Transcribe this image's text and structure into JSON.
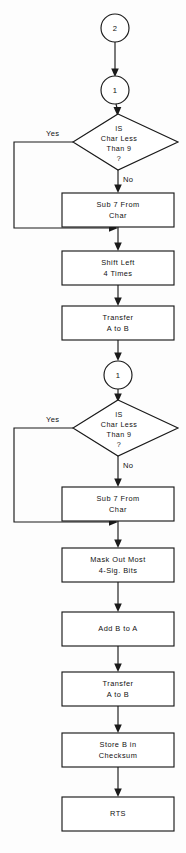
{
  "diagram": {
    "type": "flowchart",
    "colors": {
      "stroke": "#1a1a1a",
      "fill": "#ffffff",
      "background": "#fdfdfd",
      "text": "#111111"
    },
    "connectors": [
      {
        "id": "conn-top-2",
        "label": "2",
        "cx": 115,
        "cy": 28,
        "r": 14
      },
      {
        "id": "conn-top-1",
        "label": "1",
        "cx": 115,
        "cy": 90,
        "r": 14
      },
      {
        "id": "conn-mid-1",
        "label": "1",
        "cx": 118,
        "cy": 375,
        "r": 14
      }
    ],
    "decisions": [
      {
        "id": "decision-1",
        "line1": "IS",
        "line2": "Char Less",
        "line3": "Than 9",
        "line4": "?",
        "yes_label": "Yes",
        "no_label": "No",
        "cx": 118,
        "cy": 142
      },
      {
        "id": "decision-2",
        "line1": "IS",
        "line2": "Char Less",
        "line3": "Than 9",
        "line4": "?",
        "yes_label": "Yes",
        "no_label": "No",
        "cx": 118,
        "cy": 428
      }
    ],
    "processes": [
      {
        "id": "proc-sub7-a",
        "line1": "Sub 7 From",
        "line2": "Char",
        "x": 62,
        "y": 193,
        "w": 112,
        "h": 34
      },
      {
        "id": "proc-shift-left",
        "line1": "Shift Left",
        "line2": "4 Times",
        "x": 62,
        "y": 251,
        "w": 112,
        "h": 34
      },
      {
        "id": "proc-transfer-ab-1",
        "line1": "Transfer",
        "line2": "A to B",
        "x": 62,
        "y": 306,
        "w": 112,
        "h": 34
      },
      {
        "id": "proc-sub7-b",
        "line1": "Sub 7 From",
        "line2": "Char",
        "x": 62,
        "y": 487,
        "w": 112,
        "h": 34
      },
      {
        "id": "proc-mask-out",
        "line1": "Mask Out Most",
        "line2": "4-Sig. Bits",
        "x": 62,
        "y": 548,
        "w": 112,
        "h": 34
      },
      {
        "id": "proc-add-b-a",
        "line1": "Add B to A",
        "line2": "",
        "x": 62,
        "y": 612,
        "w": 112,
        "h": 34
      },
      {
        "id": "proc-transfer-ab-2",
        "line1": "Transfer",
        "line2": "A to B",
        "x": 62,
        "y": 672,
        "w": 112,
        "h": 34
      },
      {
        "id": "proc-store-b",
        "line1": "Store B in",
        "line2": "Checksum",
        "x": 62,
        "y": 733,
        "w": 112,
        "h": 34
      },
      {
        "id": "proc-rts",
        "line1": "RTS",
        "line2": "",
        "x": 62,
        "y": 797,
        "w": 112,
        "h": 34
      }
    ],
    "edges": [
      {
        "id": "edge-2-to-1",
        "from": "conn-top-2",
        "to": "conn-top-1"
      },
      {
        "id": "edge-1-to-decision1",
        "from": "conn-top-1",
        "to": "decision-1"
      },
      {
        "id": "edge-decision1-no",
        "from": "decision-1",
        "to": "proc-sub7-a",
        "label": "No"
      },
      {
        "id": "edge-decision1-yes",
        "from": "decision-1",
        "to": "merge-1",
        "label": "Yes"
      },
      {
        "id": "edge-sub7a-to-shift",
        "from": "proc-sub7-a",
        "to": "proc-shift-left"
      },
      {
        "id": "edge-shift-to-transfer",
        "from": "proc-shift-left",
        "to": "proc-transfer-ab-1"
      },
      {
        "id": "edge-transfer-to-conn1",
        "from": "proc-transfer-ab-1",
        "to": "conn-mid-1"
      },
      {
        "id": "edge-conn1-to-decision2",
        "from": "conn-mid-1",
        "to": "decision-2"
      },
      {
        "id": "edge-decision2-no",
        "from": "decision-2",
        "to": "proc-sub7-b",
        "label": "No"
      },
      {
        "id": "edge-decision2-yes",
        "from": "decision-2",
        "to": "merge-2",
        "label": "Yes"
      },
      {
        "id": "edge-sub7b-to-mask",
        "from": "proc-sub7-b",
        "to": "proc-mask-out"
      },
      {
        "id": "edge-mask-to-add",
        "from": "proc-mask-out",
        "to": "proc-add-b-a"
      },
      {
        "id": "edge-add-to-transfer2",
        "from": "proc-add-b-a",
        "to": "proc-transfer-ab-2"
      },
      {
        "id": "edge-transfer2-to-store",
        "from": "proc-transfer-ab-2",
        "to": "proc-store-b"
      },
      {
        "id": "edge-store-to-rts",
        "from": "proc-store-b",
        "to": "proc-rts"
      }
    ]
  }
}
